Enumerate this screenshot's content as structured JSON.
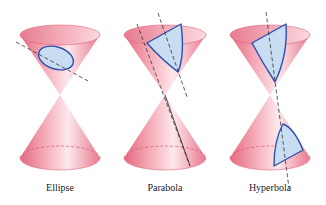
{
  "figure": {
    "panels": [
      {
        "id": "ellipse",
        "label": "Ellipse"
      },
      {
        "id": "parabola",
        "label": "Parabola"
      },
      {
        "id": "hyperbola",
        "label": "Hyperbola"
      }
    ],
    "colors": {
      "cone_fill": "#f4a7b4",
      "cone_rim": "#e0627a",
      "section_fill": "#c8dcf2",
      "section_stroke": "#2f4fae",
      "plane_line": "#333333",
      "background": "#ffffff"
    }
  }
}
